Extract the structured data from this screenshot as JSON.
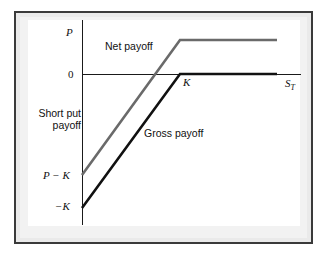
{
  "figure": {
    "kind": "payoff-diagram"
  },
  "axes": {
    "y_label": "P",
    "y_zero_label": "0",
    "x_label": "S",
    "x_label_subscript": "T",
    "strike_label": "K",
    "y_tick_p_minus_k": "P − K",
    "y_tick_minus_k": "−K",
    "y_axis_caption_line1": "Short put",
    "y_axis_caption_line2": "payoff"
  },
  "series": {
    "net": {
      "label": "Net payoff",
      "color": "#6a6a6a",
      "width": 2.6
    },
    "gross": {
      "label": "Gross payoff",
      "color": "#111111",
      "width": 2.6
    }
  },
  "colors": {
    "frame_border": "#3a3a3a",
    "frame_fill": "#eaeaea",
    "mat_fill": "#f2f2f2",
    "plot_background": "#ffffff",
    "axis": "#1a1a1a",
    "net_line": "#6a6a6a",
    "gross_line": "#111111",
    "text": "#111111"
  },
  "chart_data": {
    "type": "line",
    "title": "Short put payoff",
    "xlabel": "S_T",
    "ylabel": "Short put payoff",
    "grid": false,
    "legend": "inline-annotations",
    "x_axis": {
      "ticks": [
        "K",
        "S_T"
      ],
      "tick_positions_px": [
        180,
        288
      ],
      "zero_line_y_px": 74
    },
    "y_axis": {
      "ticks": [
        "P",
        "0",
        "P - K",
        "-K"
      ],
      "tick_positions_px": [
        40,
        74,
        175,
        208
      ]
    },
    "series": [
      {
        "name": "Net payoff",
        "color": "#6a6a6a",
        "points_px": [
          [
            82,
            175
          ],
          [
            180,
            40
          ],
          [
            277,
            40
          ]
        ],
        "description": "Short put payoff plus premium P; rises from P-K at S_T=0 to a cap of P for S_T >= K"
      },
      {
        "name": "Gross payoff",
        "color": "#111111",
        "points_px": [
          [
            82,
            208
          ],
          [
            180,
            74
          ],
          [
            277,
            74
          ]
        ],
        "description": "Short put gross payoff; rises from -K at S_T=0 to 0 for S_T >= K"
      }
    ],
    "annotations": [
      {
        "text": "Net payoff",
        "x_px": 105,
        "y_px": 41
      },
      {
        "text": "Gross payoff",
        "x_px": 144,
        "y_px": 128
      },
      {
        "text": "Short put payoff",
        "x_px": 33,
        "y_px": 108
      }
    ]
  }
}
